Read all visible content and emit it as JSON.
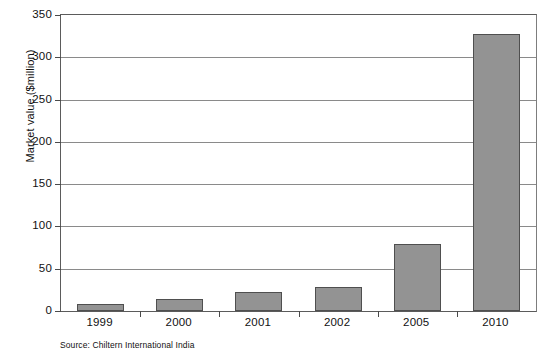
{
  "chart_data": {
    "type": "bar",
    "title": "",
    "subtitle": "",
    "xlabel": "",
    "ylabel": "Market value ($million)",
    "categories": [
      "1999",
      "2000",
      "2001",
      "2002",
      "2005",
      "2010"
    ],
    "values": [
      8,
      14,
      22,
      28,
      79,
      327
    ],
    "series": [
      {
        "name": "Market value",
        "values": [
          8,
          14,
          22,
          28,
          79,
          327
        ]
      }
    ],
    "ylim": [
      0,
      350
    ],
    "yticks": [
      0,
      50,
      100,
      150,
      200,
      250,
      300,
      350
    ],
    "ytick_labels": [
      "0",
      "50",
      "100",
      "150",
      "200",
      "250",
      "300",
      "350"
    ],
    "grid": "horizontal",
    "legend": "none",
    "bar_color": "#939393",
    "bar_border_color": "#4f4f4f",
    "gridline_color": "#8a8a8a",
    "axis_color": "#5b5b5b",
    "source_note": "Source: Chiltern International India"
  }
}
